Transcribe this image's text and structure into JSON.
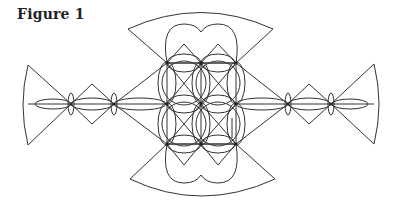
{
  "figure": {
    "caption": "Figure 1",
    "stroke_color": "#333333",
    "background": "#ffffff",
    "grid": {
      "columns_x": [
        167,
        201,
        236
      ],
      "rows_y": [
        63,
        104,
        144
      ]
    },
    "side_nodes": {
      "left": [
        71,
        114
      ],
      "right": [
        288,
        331
      ],
      "y": 104
    },
    "fans": [
      "left",
      "right",
      "top",
      "bottom"
    ]
  }
}
